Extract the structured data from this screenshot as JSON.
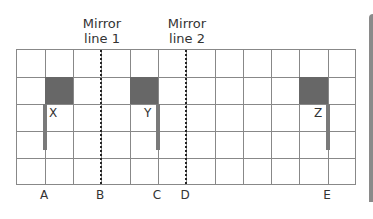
{
  "mirror_lines": [
    {
      "label_line1": "Mirror",
      "label_line2": "line 1",
      "col": 3
    },
    {
      "label_line1": "Mirror",
      "label_line2": "line 2",
      "col": 6
    }
  ],
  "grid": {
    "columns": 12,
    "rows": 5
  },
  "shapes": [
    {
      "label": "X",
      "cell_col": 1,
      "cell_row": 1,
      "stem_col": 1
    },
    {
      "label": "Y",
      "cell_col": 4,
      "cell_row": 1,
      "stem_col": 5
    },
    {
      "label": "Z",
      "cell_col": 10,
      "cell_row": 1,
      "stem_col": 11
    }
  ],
  "axis_labels": [
    {
      "label": "A",
      "col": 1
    },
    {
      "label": "B",
      "col": 3
    },
    {
      "label": "C",
      "col": 5
    },
    {
      "label": "D",
      "col": 6
    },
    {
      "label": "E",
      "col": 11
    }
  ],
  "colors": {
    "shape_fill": "#676767",
    "grid_line": "#888888",
    "mirror_line": "#222222"
  }
}
